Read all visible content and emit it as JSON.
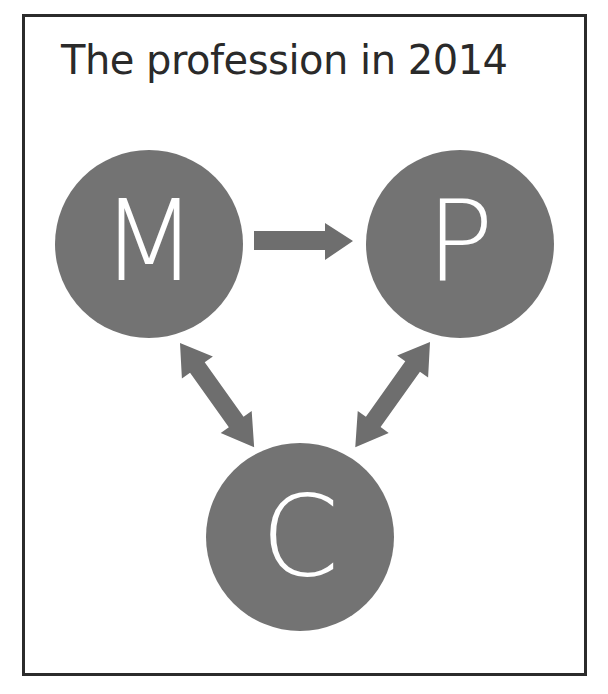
{
  "title": "The profession in 2014",
  "colors": {
    "node_fill": "#737373",
    "arrow_fill": "#6e6e6e",
    "label_color": "#ffffff",
    "border": "#2b2b2b",
    "title_color": "#2a2a2a"
  },
  "nodes": [
    {
      "id": "M",
      "label": "M",
      "cx": 149,
      "cy": 244,
      "r": 94
    },
    {
      "id": "P",
      "label": "P",
      "cx": 460,
      "cy": 244,
      "r": 94
    },
    {
      "id": "C",
      "label": "C",
      "cx": 300,
      "cy": 537,
      "r": 94
    }
  ],
  "edges": [
    {
      "from": "M",
      "to": "P",
      "type": "one-way"
    },
    {
      "from": "M",
      "to": "C",
      "type": "two-way"
    },
    {
      "from": "P",
      "to": "C",
      "type": "two-way"
    }
  ]
}
